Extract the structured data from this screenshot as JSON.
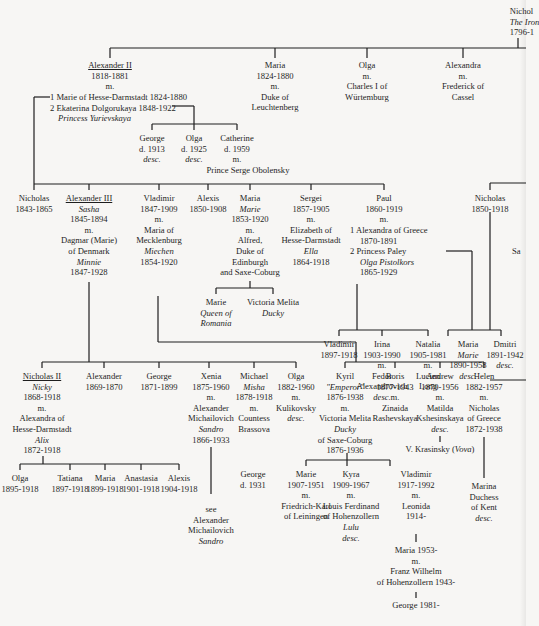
{
  "diagram": {
    "type": "family-tree",
    "line_color": "#1e1e1e",
    "background": "#f7f6f4"
  },
  "root": {
    "name": "Nicholas I",
    "name_visible": "Nichol",
    "epithet": "The Iron",
    "years": "1796-1"
  },
  "gen1": {
    "alexander2": {
      "name": "Alexander II",
      "years": "1818-1881",
      "m": "m.",
      "spouse1": "1 Marie of Hesse-Darmstadt  1824-1880",
      "spouse2": "2 Ekaterina Dolgorukaya  1848-1922",
      "spouse2_title": "Princess Yurievskaya"
    },
    "maria": {
      "name": "Maria",
      "years": "1824-1880",
      "m": "m.",
      "spouse_a": "Duke of",
      "spouse_b": "Leuchtenberg"
    },
    "olga": {
      "name": "Olga",
      "m": "m.",
      "spouse_a": "Charles I of",
      "spouse_b": "Würtemburg"
    },
    "alexandra": {
      "name": "Alexandra",
      "m": "m.",
      "spouse_a": "Frederick of",
      "spouse_b": "Cassel"
    },
    "nicholas": {
      "name": "Nicholas",
      "years": "1831-1891"
    }
  },
  "yurievsky_children": [
    {
      "name": "George",
      "years": "d. 1913",
      "note": "desc."
    },
    {
      "name": "Olga",
      "years": "d. 1925",
      "note": "desc."
    },
    {
      "name": "Catherine",
      "years": "d. 1959",
      "m": "m.",
      "spouse": "Prince Serge Obolensky"
    }
  ],
  "gen2": {
    "nicholas": {
      "name": "Nicholas",
      "years": "1843-1865"
    },
    "alexander3": {
      "name": "Alexander III",
      "nickname": "Sasha",
      "years": "1845-1894",
      "m": "m.",
      "spouse_a": "Dagmar (Marie)",
      "spouse_b": "of Denmark",
      "spouse_nick": "Minnie",
      "spouse_years": "1847-1928"
    },
    "vladimir": {
      "name": "Vladimir",
      "years": "1847-1909",
      "m": "m.",
      "spouse_a": "Maria of",
      "spouse_b": "Mecklenburg",
      "spouse_nick": "Miechen",
      "spouse_years": "1854-1920"
    },
    "alexis": {
      "name": "Alexis",
      "years": "1850-1908"
    },
    "maria": {
      "name": "Maria",
      "nickname": "Marie",
      "years": "1853-1920",
      "m": "m.",
      "spouse_a": "Alfred,",
      "spouse_b": "Duke of",
      "spouse_c": "Edinburgh",
      "spouse_d": "and Saxe-Coburg"
    },
    "sergei": {
      "name": "Sergei",
      "years": "1857-1905",
      "m": "m.",
      "spouse_a": "Elizabeth of",
      "spouse_b": "Hesse-Darmstadt",
      "spouse_nick": "Ella",
      "spouse_years": "1864-1918"
    },
    "paul": {
      "name": "Paul",
      "years": "1860-1919",
      "m": "m.",
      "spouse1": "1  Alexandra of Greece",
      "spouse1_years": "1870-1891",
      "spouse2": "2  Princess Paley",
      "spouse2_nick": "Olga Pistolkors",
      "spouse2_years": "1865-1929"
    },
    "nicholas_right": {
      "name": "Nicholas",
      "years": "1850-1918"
    },
    "sa_partial": "Sa"
  },
  "edinburgh_children": [
    {
      "name": "Marie",
      "title_a": "Queen of",
      "title_b": "Romania"
    },
    {
      "name": "Victoria Melita",
      "nickname": "Ducky"
    }
  ],
  "paul_children_paley": [
    {
      "name": "Vladimir",
      "years": "1897-1918"
    },
    {
      "name": "Irina",
      "years": "1903-1990",
      "m": "m.",
      "spouse_a": "Fedor",
      "spouse_b": "Alexandrovich",
      "note": "desc."
    },
    {
      "name": "Natalia",
      "years": "1905-1981",
      "m": "m.",
      "spouse_a": "Lucien",
      "spouse_b": "Long"
    }
  ],
  "paul_children_greece": [
    {
      "name": "Maria",
      "nickname": "Marie",
      "years": "1890-1958",
      "note": "desc."
    },
    {
      "name": "Dmitri",
      "years": "1891-1942",
      "note": "desc."
    }
  ],
  "gen3_alexander3": [
    {
      "name": "Nicholas II",
      "nickname": "Nicky",
      "years": "1868-1918",
      "m": "m.",
      "spouse_a": "Alexandra of",
      "spouse_b": "Hesse-Darmstadt",
      "spouse_nick": "Alix",
      "spouse_years": "1872-1918"
    },
    {
      "name": "Alexander",
      "years": "1869-1870"
    },
    {
      "name": "George",
      "years": "1871-1899"
    },
    {
      "name": "Xenia",
      "years": "1875-1960",
      "m": "m.",
      "spouse_a": "Alexander",
      "spouse_b": "Michailovich",
      "spouse_nick": "Sandro",
      "spouse_years": "1866-1933"
    },
    {
      "name": "Michael",
      "nickname": "Misha",
      "years": "1878-1918",
      "m": "m.",
      "spouse_a": "Countess",
      "spouse_b": "Brassova"
    },
    {
      "name": "Olga",
      "years": "1882-1960",
      "m": "m.",
      "spouse": "Kulikovsky",
      "note": "desc."
    }
  ],
  "gen3_vladimir": [
    {
      "name": "Kyril",
      "nickname": "\"Emperor\"",
      "years": "1876-1938",
      "m": "m.",
      "spouse_a": "Victoria Melita",
      "spouse_nick": "Ducky",
      "spouse_b": "of Saxe-Coburg",
      "spouse_years": "1876-1936"
    },
    {
      "name": "Boris",
      "years": "1877-1943",
      "m": "m.",
      "spouse_a": "Zinaida",
      "spouse_b": "Rashevskaya"
    },
    {
      "name": "Andrew",
      "years": "1879-1956",
      "m": "m.",
      "spouse_a": "Matilda",
      "spouse_b": "Kshesinskaya",
      "note": "desc.",
      "child": "V. Krasinsky",
      "child_nick": "Vova"
    },
    {
      "name": "Helen",
      "years": "1882-1957",
      "m": "m.",
      "spouse_a": "Nicholas",
      "spouse_b": "of Greece",
      "spouse_years": "1872-1938"
    }
  ],
  "nicholas2_children": [
    {
      "name": "Olga",
      "years": "1895-1918"
    },
    {
      "name": "Tatiana",
      "years": "1897-1918"
    },
    {
      "name": "Maria",
      "years": "1899-1918"
    },
    {
      "name": "Anastasia",
      "years": "1901-1918"
    },
    {
      "name": "Alexis",
      "years": "1904-1918"
    }
  ],
  "michael_child": {
    "name": "George",
    "years": "d. 1931"
  },
  "xenia_see": {
    "see": "see",
    "a": "Alexander",
    "b": "Michailovich",
    "nick": "Sandro"
  },
  "kyril_children": [
    {
      "name": "Marie",
      "years": "1907-1951",
      "m": "m.",
      "spouse_a": "Friedrich-Karl",
      "spouse_b": "of Leiningen"
    },
    {
      "name": "Kyra",
      "years": "1909-1967",
      "m": "m.",
      "spouse_a": "Louis Ferdinand",
      "spouse_b": "of Hohenzollern",
      "spouse_nick": "Lulu",
      "note": "desc."
    },
    {
      "name": "Vladimir",
      "years": "1917-1992",
      "m": "m.",
      "spouse_a": "Leonida",
      "spouse_years": "1914-"
    }
  ],
  "helen_child": {
    "name": "Marina",
    "title_a": "Duchess",
    "title_b": "of Kent",
    "note": "desc."
  },
  "vladimir_line": {
    "maria": "Maria 1953-",
    "m": "m.",
    "spouse_a": "Franz Wilhelm",
    "spouse_b": "of Hohenzollern 1943-",
    "son": "George 1981-"
  }
}
